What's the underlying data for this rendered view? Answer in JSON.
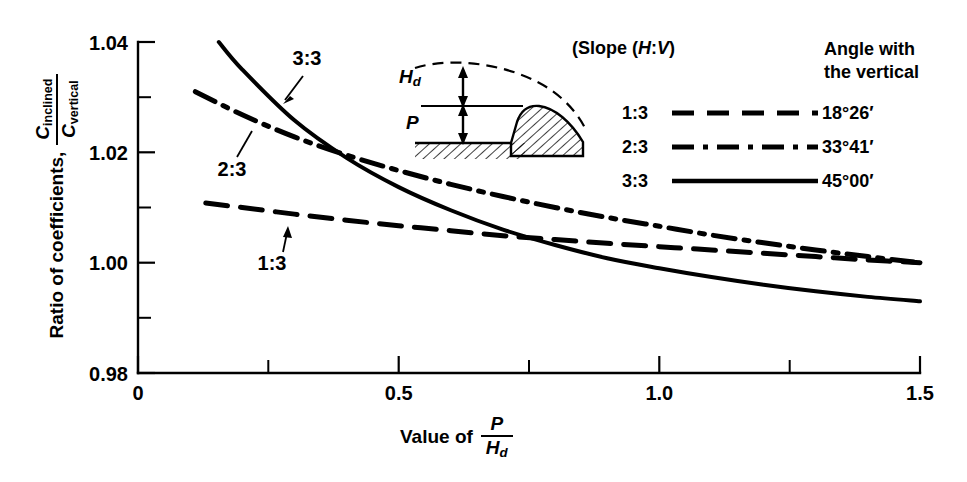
{
  "figure": {
    "background": "#ffffff",
    "ink": "#000000"
  },
  "axes": {
    "y": {
      "title_prefix": "Ratio of coefficients,",
      "title_numerator": "C",
      "title_numerator_sub": "inclined",
      "title_denominator": "C",
      "title_denominator_sub": "vertical",
      "tick_labels": [
        "1.04",
        "1.02",
        "1.00",
        "0.98"
      ],
      "tick_values": [
        1.04,
        1.02,
        1.0,
        0.98
      ],
      "minor_tick_values": [
        1.03,
        1.01,
        0.99
      ],
      "min": 0.98,
      "max": 1.04
    },
    "x": {
      "title_prefix": "Value of",
      "title_numerator": "P",
      "title_denominator": "H",
      "title_denominator_sub": "d",
      "tick_labels": [
        "0",
        "0.5",
        "1.0",
        "1.5"
      ],
      "tick_values": [
        0,
        0.5,
        1.0,
        1.5
      ],
      "minor_tick_values": [
        0.25,
        0.75,
        1.25
      ],
      "min": 0,
      "max": 1.5
    }
  },
  "legend": {
    "slope_title": "(Slope (H:V)",
    "slope_title_plain": "(Slope (",
    "slope_title_h": "H",
    "slope_title_colon": ":",
    "slope_title_v": "V",
    "slope_title_close": ")",
    "angle_title_line1": "Angle with",
    "angle_title_line2": "the vertical",
    "entries": [
      {
        "slope": "1:3",
        "angle": "18°26′",
        "style": "dashed"
      },
      {
        "slope": "2:3",
        "angle": "33°41′",
        "style": "dashdot"
      },
      {
        "slope": "3:3",
        "angle": "45°00′",
        "style": "solid"
      }
    ]
  },
  "inset": {
    "label_head": "H",
    "label_head_sub": "d",
    "label_height": "P"
  },
  "annotations": [
    {
      "text": "3:3",
      "x": 307,
      "y": 65
    },
    {
      "text": "2:3",
      "x": 232,
      "y": 170
    },
    {
      "text": "1:3",
      "x": 272,
      "y": 262
    }
  ],
  "chart_data": {
    "type": "line",
    "title": "",
    "xlabel": "Value of P/Hd",
    "ylabel": "Ratio of coefficients, C_inclined / C_vertical",
    "xlim": [
      0,
      1.5
    ],
    "ylim": [
      0.98,
      1.04
    ],
    "grid": false,
    "legend_position": "top-right",
    "series": [
      {
        "name": "1:3",
        "angle_with_vertical": "18°26′",
        "style": "dashed",
        "x": [
          0.13,
          0.2,
          0.3,
          0.4,
          0.5,
          0.6,
          0.7,
          0.8,
          0.9,
          1.0,
          1.1,
          1.2,
          1.3,
          1.4,
          1.5
        ],
        "y": [
          1.0108,
          1.01,
          1.0088,
          1.0077,
          1.0067,
          1.0058,
          1.0049,
          1.0042,
          1.0035,
          1.0029,
          1.0023,
          1.0017,
          1.0011,
          1.0005,
          1.0
        ]
      },
      {
        "name": "2:3",
        "angle_with_vertical": "33°41′",
        "style": "dashdot",
        "x": [
          0.11,
          0.2,
          0.3,
          0.4,
          0.5,
          0.6,
          0.7,
          0.8,
          0.9,
          1.0,
          1.1,
          1.2,
          1.3,
          1.4,
          1.5
        ],
        "y": [
          1.031,
          1.0268,
          1.0228,
          1.0195,
          1.0167,
          1.0142,
          1.012,
          1.01,
          1.0082,
          1.0066,
          1.005,
          1.0036,
          1.0023,
          1.0011,
          1.0
        ]
      },
      {
        "name": "3:3",
        "angle_with_vertical": "45°00′",
        "style": "solid",
        "x": [
          0.155,
          0.2,
          0.3,
          0.4,
          0.5,
          0.6,
          0.7,
          0.8,
          0.9,
          1.0,
          1.1,
          1.2,
          1.3,
          1.4,
          1.5
        ],
        "y": [
          1.04,
          1.035,
          1.0258,
          1.019,
          1.0137,
          1.0095,
          1.006,
          1.0032,
          1.0008,
          0.999,
          0.9974,
          0.996,
          0.9948,
          0.9938,
          0.993
        ]
      }
    ]
  }
}
